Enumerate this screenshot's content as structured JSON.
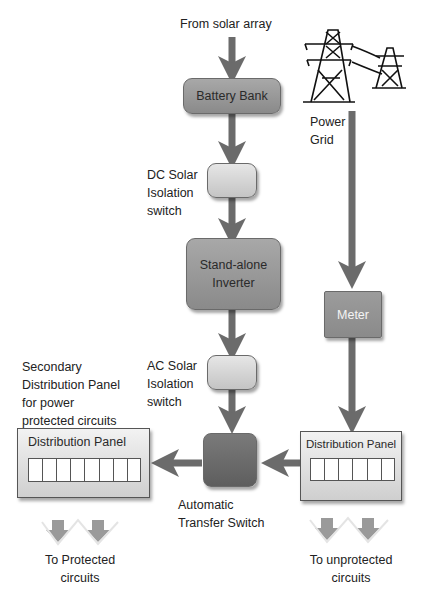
{
  "diagram": {
    "title_source": "From solar array",
    "nodes": {
      "battery_bank": "Battery Bank",
      "dc_switch_label": [
        "DC Solar",
        "Isolation",
        "switch"
      ],
      "inverter": [
        "Stand-alone",
        "Inverter"
      ],
      "ac_switch_label": [
        "AC Solar",
        "Isolation",
        "switch"
      ],
      "ats_label": [
        "Automatic",
        "Transfer Switch"
      ],
      "power_grid_label": [
        "Power",
        "Grid"
      ],
      "meter": "Meter",
      "secondary_panel_label": [
        "Secondary",
        "Distribution Panel",
        "for power",
        "protected circuits"
      ],
      "left_panel_title": "Distribution Panel",
      "right_panel_title": "Distribution Panel",
      "left_outputs_label": [
        "To Protected",
        "circuits"
      ],
      "right_outputs_label": [
        "To unprotected",
        "circuits"
      ]
    },
    "left_panel_slots": 8,
    "right_panel_slots": 6,
    "edges": [
      {
        "from": "solar array",
        "to": "Battery Bank"
      },
      {
        "from": "Battery Bank",
        "to": "DC Solar Isolation switch"
      },
      {
        "from": "DC Solar Isolation switch",
        "to": "Stand-alone Inverter"
      },
      {
        "from": "Stand-alone Inverter",
        "to": "AC Solar Isolation switch"
      },
      {
        "from": "AC Solar Isolation switch",
        "to": "Automatic Transfer Switch"
      },
      {
        "from": "Power Grid",
        "to": "Meter"
      },
      {
        "from": "Meter",
        "to": "Distribution Panel (right)"
      },
      {
        "from": "Distribution Panel (right)",
        "to": "Automatic Transfer Switch"
      },
      {
        "from": "Automatic Transfer Switch",
        "to": "Distribution Panel (left)"
      },
      {
        "from": "Distribution Panel (left)",
        "to": "To Protected circuits"
      },
      {
        "from": "Distribution Panel (right)",
        "to": "To unprotected circuits"
      }
    ],
    "colors": {
      "arrow": "#6b6b6b",
      "light_box": "#d4d4d4",
      "mid_box": "#999999",
      "dark_box": "#6a6a6a",
      "output_arrow": "#999999"
    }
  }
}
